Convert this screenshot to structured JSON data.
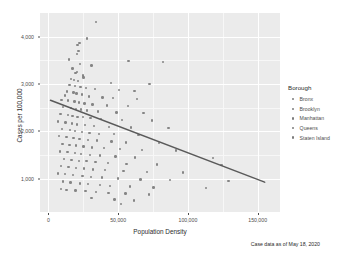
{
  "chart_data": {
    "type": "scatter",
    "title": "",
    "xlabel": "Population Density",
    "ylabel": "Cases per 100,000",
    "caption": "Case data as of May 18, 2020",
    "xlim": [
      -6000,
      166000
    ],
    "ylim": [
      300,
      4500
    ],
    "xticks": [
      0,
      50000,
      100000,
      150000
    ],
    "xticklabels": [
      "0",
      "50,000",
      "100,000",
      "150,000"
    ],
    "yticks": [
      1000,
      2000,
      3000,
      4000
    ],
    "yticklabels": [
      "1,000",
      "2,000",
      "3,000",
      "4,000"
    ],
    "grid": true,
    "legend": {
      "title": "Borough",
      "position": "right",
      "entries": [
        "Bronx",
        "Brooklyn",
        "Manhattan",
        "Queens",
        "Staten Island"
      ]
    },
    "point_color": "#7c7c7c",
    "panel_color": "#ebebeb",
    "grid_color": "#ffffff",
    "trendline": {
      "type": "linear",
      "color": "#5a5a5a",
      "x": [
        1500,
        155000
      ],
      "y": [
        2660,
        930
      ]
    },
    "points": [
      [
        34000,
        4310
      ],
      [
        27500,
        3960
      ],
      [
        22300,
        3870
      ],
      [
        20800,
        3820
      ],
      [
        21500,
        3700
      ],
      [
        20400,
        3640
      ],
      [
        14800,
        3520
      ],
      [
        57500,
        3490
      ],
      [
        82000,
        3470
      ],
      [
        22700,
        3420
      ],
      [
        31000,
        3390
      ],
      [
        17400,
        3330
      ],
      [
        20300,
        3260
      ],
      [
        19500,
        3230
      ],
      [
        24700,
        3180
      ],
      [
        25300,
        3140
      ],
      [
        16300,
        3110
      ],
      [
        18400,
        3080
      ],
      [
        21400,
        3060
      ],
      [
        44800,
        3020
      ],
      [
        72500,
        3000
      ],
      [
        15200,
        2980
      ],
      [
        19000,
        2960
      ],
      [
        23100,
        2940
      ],
      [
        26900,
        2920
      ],
      [
        33500,
        2900
      ],
      [
        50600,
        2880
      ],
      [
        61800,
        2860
      ],
      [
        13200,
        2840
      ],
      [
        17900,
        2820
      ],
      [
        20100,
        2800
      ],
      [
        24200,
        2780
      ],
      [
        11800,
        2760
      ],
      [
        28900,
        2740
      ],
      [
        38700,
        2720
      ],
      [
        46200,
        2700
      ],
      [
        63500,
        2690
      ],
      [
        9400,
        2670
      ],
      [
        14100,
        2650
      ],
      [
        18700,
        2630
      ],
      [
        22000,
        2610
      ],
      [
        25900,
        2590
      ],
      [
        31600,
        2570
      ],
      [
        41800,
        2550
      ],
      [
        57000,
        2540
      ],
      [
        10700,
        2520
      ],
      [
        16000,
        2500
      ],
      [
        19800,
        2480
      ],
      [
        23600,
        2460
      ],
      [
        27800,
        2440
      ],
      [
        35400,
        2420
      ],
      [
        48900,
        2400
      ],
      [
        68300,
        2390
      ],
      [
        8600,
        2370
      ],
      [
        13900,
        2350
      ],
      [
        17200,
        2330
      ],
      [
        21000,
        2310
      ],
      [
        24900,
        2300
      ],
      [
        30200,
        2280
      ],
      [
        37600,
        2260
      ],
      [
        52700,
        2240
      ],
      [
        74100,
        2230
      ],
      [
        6800,
        2210
      ],
      [
        12400,
        2190
      ],
      [
        16800,
        2170
      ],
      [
        20600,
        2150
      ],
      [
        26100,
        2130
      ],
      [
        32800,
        2110
      ],
      [
        43500,
        2100
      ],
      [
        59400,
        2080
      ],
      [
        86200,
        2070
      ],
      [
        9900,
        2050
      ],
      [
        15600,
        2030
      ],
      [
        19200,
        2010
      ],
      [
        23900,
        1990
      ],
      [
        29500,
        1970
      ],
      [
        36200,
        1950
      ],
      [
        47100,
        1940
      ],
      [
        64700,
        1920
      ],
      [
        7500,
        1900
      ],
      [
        12900,
        1880
      ],
      [
        18100,
        1860
      ],
      [
        22400,
        1840
      ],
      [
        28200,
        1820
      ],
      [
        34900,
        1810
      ],
      [
        45300,
        1790
      ],
      [
        55800,
        1770
      ],
      [
        79400,
        1760
      ],
      [
        10200,
        1740
      ],
      [
        15100,
        1720
      ],
      [
        19600,
        1700
      ],
      [
        25100,
        1680
      ],
      [
        31200,
        1660
      ],
      [
        39800,
        1650
      ],
      [
        51400,
        1630
      ],
      [
        67200,
        1610
      ],
      [
        91500,
        1600
      ],
      [
        8200,
        1580
      ],
      [
        13600,
        1560
      ],
      [
        18900,
        1540
      ],
      [
        23400,
        1520
      ],
      [
        29800,
        1500
      ],
      [
        37100,
        1490
      ],
      [
        48200,
        1470
      ],
      [
        62300,
        1450
      ],
      [
        118000,
        1440
      ],
      [
        11300,
        1420
      ],
      [
        16500,
        1400
      ],
      [
        21800,
        1380
      ],
      [
        27200,
        1370
      ],
      [
        33900,
        1350
      ],
      [
        42600,
        1330
      ],
      [
        56100,
        1310
      ],
      [
        77800,
        1300
      ],
      [
        124000,
        1290
      ],
      [
        9100,
        1270
      ],
      [
        14400,
        1250
      ],
      [
        20000,
        1230
      ],
      [
        25700,
        1220
      ],
      [
        32100,
        1200
      ],
      [
        40500,
        1180
      ],
      [
        53900,
        1160
      ],
      [
        70600,
        1150
      ],
      [
        96400,
        1130
      ],
      [
        7100,
        1110
      ],
      [
        12100,
        1100
      ],
      [
        17700,
        1080
      ],
      [
        24400,
        1060
      ],
      [
        30600,
        1040
      ],
      [
        38300,
        1030
      ],
      [
        49700,
        1010
      ],
      [
        66000,
        990
      ],
      [
        87300,
        970
      ],
      [
        129000,
        960
      ],
      [
        10500,
        940
      ],
      [
        15900,
        920
      ],
      [
        22600,
        900
      ],
      [
        28500,
        890
      ],
      [
        36800,
        870
      ],
      [
        44100,
        850
      ],
      [
        58600,
        840
      ],
      [
        75300,
        820
      ],
      [
        113000,
        810
      ],
      [
        8900,
        790
      ],
      [
        13100,
        770
      ],
      [
        19400,
        750
      ],
      [
        26500,
        740
      ],
      [
        34200,
        720
      ],
      [
        43200,
        700
      ],
      [
        55200,
        690
      ],
      [
        71900,
        670
      ],
      [
        30900,
        600
      ],
      [
        47500,
        560
      ],
      [
        61200,
        540
      ],
      [
        52000,
        470
      ]
    ]
  }
}
